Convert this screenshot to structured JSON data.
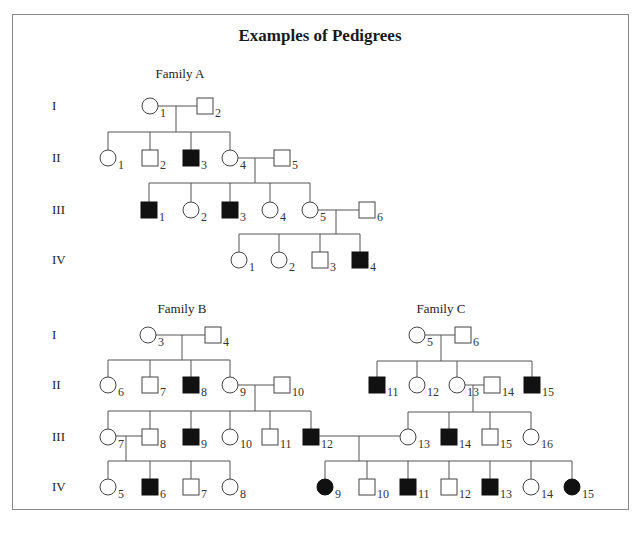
{
  "title": "Examples of Pedigrees",
  "families": [
    {
      "id": "A",
      "label": "Family A",
      "label_pos": [
        180,
        78
      ],
      "generation_labels": [
        {
          "text": "I",
          "y": 106
        },
        {
          "text": "II",
          "y": 158
        },
        {
          "text": "III",
          "y": 210
        },
        {
          "text": "IV",
          "y": 260
        }
      ],
      "individuals": [
        {
          "gen": "I",
          "num": "1",
          "sex": "female",
          "affected": false,
          "x": 150,
          "y": 106
        },
        {
          "gen": "I",
          "num": "2",
          "sex": "male",
          "affected": false,
          "x": 205,
          "y": 106
        },
        {
          "gen": "II",
          "num": "1",
          "sex": "female",
          "affected": false,
          "x": 108,
          "y": 158
        },
        {
          "gen": "II",
          "num": "2",
          "sex": "male",
          "affected": false,
          "x": 150,
          "y": 158
        },
        {
          "gen": "II",
          "num": "3",
          "sex": "male",
          "affected": true,
          "x": 191,
          "y": 158
        },
        {
          "gen": "II",
          "num": "4",
          "sex": "female",
          "affected": false,
          "x": 230,
          "y": 158
        },
        {
          "gen": "II",
          "num": "5",
          "sex": "male",
          "affected": false,
          "x": 282,
          "y": 158
        },
        {
          "gen": "III",
          "num": "1",
          "sex": "male",
          "affected": true,
          "x": 149,
          "y": 210
        },
        {
          "gen": "III",
          "num": "2",
          "sex": "female",
          "affected": false,
          "x": 191,
          "y": 210
        },
        {
          "gen": "III",
          "num": "3",
          "sex": "male",
          "affected": true,
          "x": 230,
          "y": 210
        },
        {
          "gen": "III",
          "num": "4",
          "sex": "female",
          "affected": false,
          "x": 270,
          "y": 210
        },
        {
          "gen": "III",
          "num": "5",
          "sex": "female",
          "affected": false,
          "x": 310,
          "y": 210
        },
        {
          "gen": "III",
          "num": "6",
          "sex": "male",
          "affected": false,
          "x": 367,
          "y": 210
        },
        {
          "gen": "IV",
          "num": "1",
          "sex": "female",
          "affected": false,
          "x": 239,
          "y": 260
        },
        {
          "gen": "IV",
          "num": "2",
          "sex": "female",
          "affected": false,
          "x": 279,
          "y": 260
        },
        {
          "gen": "IV",
          "num": "3",
          "sex": "male",
          "affected": false,
          "x": 320,
          "y": 260
        },
        {
          "gen": "IV",
          "num": "4",
          "sex": "male",
          "affected": true,
          "x": 360,
          "y": 260
        }
      ],
      "lines": [
        [
          158,
          106,
          197,
          106
        ],
        [
          176,
          106,
          176,
          132
        ],
        [
          108,
          132,
          230,
          132
        ],
        [
          108,
          132,
          108,
          150
        ],
        [
          150,
          132,
          150,
          150
        ],
        [
          191,
          132,
          191,
          150
        ],
        [
          230,
          132,
          230,
          150
        ],
        [
          238,
          158,
          274,
          158
        ],
        [
          255,
          158,
          255,
          183
        ],
        [
          149,
          183,
          310,
          183
        ],
        [
          149,
          183,
          149,
          202
        ],
        [
          191,
          183,
          191,
          202
        ],
        [
          230,
          183,
          230,
          202
        ],
        [
          270,
          183,
          270,
          202
        ],
        [
          310,
          183,
          310,
          202
        ],
        [
          318,
          210,
          359,
          210
        ],
        [
          336,
          210,
          336,
          234
        ],
        [
          239,
          234,
          360,
          234
        ],
        [
          239,
          234,
          239,
          252
        ],
        [
          279,
          234,
          279,
          252
        ],
        [
          320,
          234,
          320,
          252
        ],
        [
          360,
          234,
          360,
          252
        ]
      ]
    },
    {
      "id": "B",
      "label": "Family B",
      "label_pos": [
        182,
        313
      ],
      "generation_labels": [
        {
          "text": "I",
          "y": 335
        },
        {
          "text": "II",
          "y": 385
        },
        {
          "text": "III",
          "y": 437
        },
        {
          "text": "IV",
          "y": 487
        }
      ],
      "individuals": [
        {
          "gen": "I",
          "num": "3",
          "sex": "female",
          "affected": false,
          "x": 148,
          "y": 335
        },
        {
          "gen": "I",
          "num": "4",
          "sex": "male",
          "affected": false,
          "x": 213,
          "y": 335
        },
        {
          "gen": "II",
          "num": "6",
          "sex": "female",
          "affected": false,
          "x": 108,
          "y": 385
        },
        {
          "gen": "II",
          "num": "7",
          "sex": "male",
          "affected": false,
          "x": 150,
          "y": 385
        },
        {
          "gen": "II",
          "num": "8",
          "sex": "male",
          "affected": true,
          "x": 191,
          "y": 385
        },
        {
          "gen": "II",
          "num": "9",
          "sex": "female",
          "affected": false,
          "x": 230,
          "y": 385
        },
        {
          "gen": "II",
          "num": "10",
          "sex": "male",
          "affected": false,
          "x": 282,
          "y": 385
        },
        {
          "gen": "III",
          "num": "7",
          "sex": "female",
          "affected": false,
          "x": 108,
          "y": 437
        },
        {
          "gen": "III",
          "num": "8",
          "sex": "male",
          "affected": false,
          "x": 150,
          "y": 437
        },
        {
          "gen": "III",
          "num": "9",
          "sex": "male",
          "affected": true,
          "x": 191,
          "y": 437
        },
        {
          "gen": "III",
          "num": "10",
          "sex": "female",
          "affected": false,
          "x": 230,
          "y": 437
        },
        {
          "gen": "III",
          "num": "11",
          "sex": "male",
          "affected": false,
          "x": 270,
          "y": 437
        },
        {
          "gen": "III",
          "num": "12",
          "sex": "male",
          "affected": true,
          "x": 311,
          "y": 437
        },
        {
          "gen": "IV",
          "num": "5",
          "sex": "female",
          "affected": false,
          "x": 108,
          "y": 487
        },
        {
          "gen": "IV",
          "num": "6",
          "sex": "male",
          "affected": true,
          "x": 150,
          "y": 487
        },
        {
          "gen": "IV",
          "num": "7",
          "sex": "male",
          "affected": false,
          "x": 191,
          "y": 487
        },
        {
          "gen": "IV",
          "num": "8",
          "sex": "female",
          "affected": false,
          "x": 230,
          "y": 487
        }
      ],
      "lines": [
        [
          156,
          335,
          205,
          335
        ],
        [
          182,
          335,
          182,
          360
        ],
        [
          108,
          360,
          230,
          360
        ],
        [
          108,
          360,
          108,
          377
        ],
        [
          150,
          360,
          150,
          377
        ],
        [
          191,
          360,
          191,
          377
        ],
        [
          230,
          360,
          230,
          377
        ],
        [
          238,
          385,
          274,
          385
        ],
        [
          255,
          385,
          255,
          411
        ],
        [
          108,
          411,
          311,
          411
        ],
        [
          108,
          411,
          108,
          429
        ],
        [
          150,
          411,
          150,
          429
        ],
        [
          191,
          411,
          191,
          429
        ],
        [
          230,
          411,
          230,
          429
        ],
        [
          270,
          411,
          270,
          429
        ],
        [
          311,
          411,
          311,
          429
        ],
        [
          116,
          436,
          142,
          436
        ],
        [
          126,
          436,
          126,
          461
        ],
        [
          108,
          461,
          230,
          461
        ],
        [
          108,
          461,
          108,
          479
        ],
        [
          150,
          461,
          150,
          479
        ],
        [
          191,
          461,
          191,
          479
        ],
        [
          230,
          461,
          230,
          479
        ]
      ]
    },
    {
      "id": "C",
      "label": "Family C",
      "label_pos": [
        441,
        313
      ],
      "individuals": [
        {
          "gen": "I",
          "num": "5",
          "sex": "female",
          "affected": false,
          "x": 417,
          "y": 335
        },
        {
          "gen": "I",
          "num": "6",
          "sex": "male",
          "affected": false,
          "x": 463,
          "y": 335
        },
        {
          "gen": "II",
          "num": "11",
          "sex": "male",
          "affected": true,
          "x": 377,
          "y": 385
        },
        {
          "gen": "II",
          "num": "12",
          "sex": "female",
          "affected": false,
          "x": 417,
          "y": 385
        },
        {
          "gen": "II",
          "num": "13",
          "sex": "female",
          "affected": false,
          "x": 457,
          "y": 385
        },
        {
          "gen": "II",
          "num": "14",
          "sex": "male",
          "affected": false,
          "x": 492,
          "y": 385
        },
        {
          "gen": "II",
          "num": "15",
          "sex": "male",
          "affected": true,
          "x": 532,
          "y": 385
        },
        {
          "gen": "III",
          "num": "13",
          "sex": "female",
          "affected": false,
          "x": 408,
          "y": 437
        },
        {
          "gen": "III",
          "num": "14",
          "sex": "male",
          "affected": true,
          "x": 449,
          "y": 437
        },
        {
          "gen": "III",
          "num": "15",
          "sex": "male",
          "affected": false,
          "x": 490,
          "y": 437
        },
        {
          "gen": "III",
          "num": "16",
          "sex": "female",
          "affected": false,
          "x": 531,
          "y": 437
        },
        {
          "gen": "IV",
          "num": "9",
          "sex": "female",
          "affected": true,
          "x": 325,
          "y": 487
        },
        {
          "gen": "IV",
          "num": "10",
          "sex": "male",
          "affected": false,
          "x": 367,
          "y": 487
        },
        {
          "gen": "IV",
          "num": "11",
          "sex": "male",
          "affected": true,
          "x": 408,
          "y": 487
        },
        {
          "gen": "IV",
          "num": "12",
          "sex": "male",
          "affected": false,
          "x": 449,
          "y": 487
        },
        {
          "gen": "IV",
          "num": "13",
          "sex": "male",
          "affected": true,
          "x": 490,
          "y": 487
        },
        {
          "gen": "IV",
          "num": "14",
          "sex": "female",
          "affected": false,
          "x": 531,
          "y": 487
        },
        {
          "gen": "IV",
          "num": "15",
          "sex": "female",
          "affected": true,
          "x": 572,
          "y": 487
        }
      ],
      "lines": [
        [
          425,
          335,
          455,
          335
        ],
        [
          441,
          335,
          441,
          361
        ],
        [
          377,
          361,
          532,
          361
        ],
        [
          377,
          361,
          377,
          377
        ],
        [
          417,
          361,
          417,
          377
        ],
        [
          457,
          361,
          457,
          377
        ],
        [
          532,
          361,
          532,
          377
        ],
        [
          465,
          385,
          484,
          385
        ],
        [
          473,
          385,
          473,
          412
        ],
        [
          408,
          412,
          531,
          412
        ],
        [
          408,
          412,
          408,
          429
        ],
        [
          449,
          412,
          449,
          429
        ],
        [
          490,
          412,
          490,
          429
        ],
        [
          531,
          412,
          531,
          429
        ],
        [
          319,
          436,
          400,
          436
        ],
        [
          359,
          436,
          359,
          461
        ],
        [
          325,
          461,
          572,
          461
        ],
        [
          325,
          461,
          325,
          479
        ],
        [
          367,
          461,
          367,
          479
        ],
        [
          408,
          461,
          408,
          479
        ],
        [
          449,
          461,
          449,
          479
        ],
        [
          490,
          461,
          490,
          479
        ],
        [
          531,
          461,
          531,
          479
        ],
        [
          572,
          461,
          572,
          479
        ]
      ]
    }
  ],
  "style": {
    "line_color": "#555555",
    "affected_fill": "#111111",
    "unaffected_fill": "#ffffff",
    "symbol_half_size": 8
  }
}
